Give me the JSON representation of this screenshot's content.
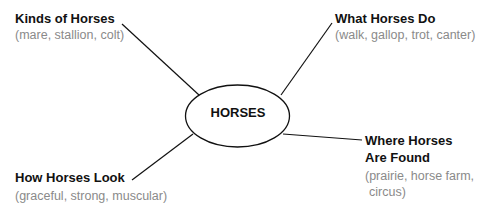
{
  "diagram": {
    "type": "web-map",
    "center": {
      "label": "HORSES"
    },
    "branches": [
      {
        "title": "Kinds of Horses",
        "details": "(mare, stallion, colt)"
      },
      {
        "title": "What Horses Do",
        "details": "(walk, gallop, trot, canter)"
      },
      {
        "title_line1": "Where Horses",
        "title_line2": "Are Found",
        "details_line1": "(prairie, horse farm,",
        "details_line2": "circus)"
      },
      {
        "title": "How Horses Look",
        "details": "(graceful, strong, muscular)"
      }
    ]
  }
}
